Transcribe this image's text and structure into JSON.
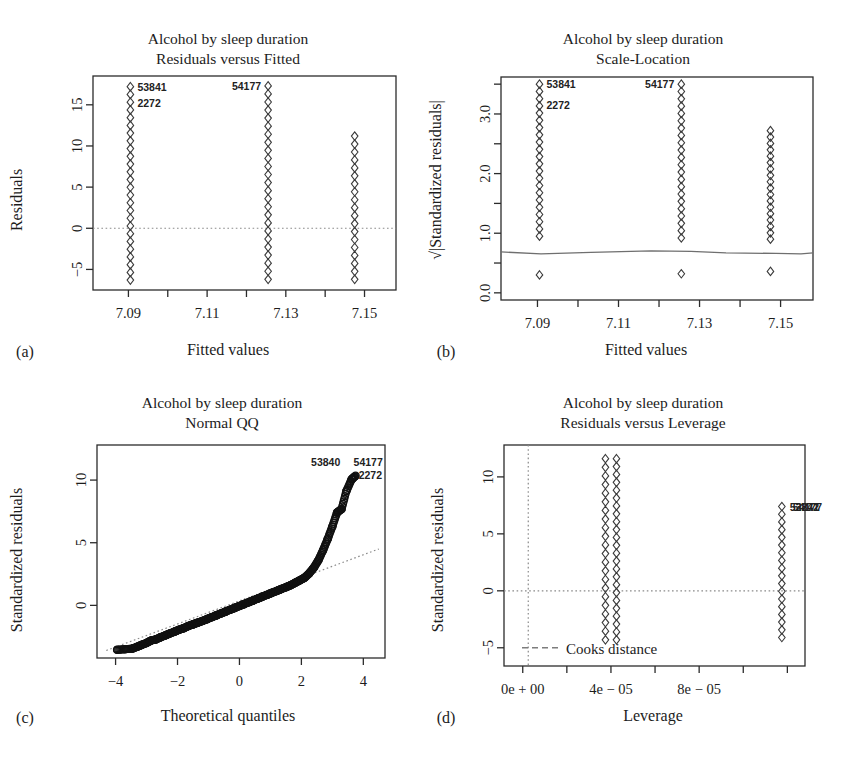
{
  "figure": {
    "width": 842,
    "height": 761,
    "background": "#ffffff",
    "ink": "#1c1c1c",
    "point_stroke": "#3a3a3a",
    "reference_line_color": "#8a8a8a",
    "loess_color": "#6f6f6f"
  },
  "panels": [
    {
      "letter": "(a)",
      "title_line1": "Alcohol by sleep duration",
      "title_line2": "Residuals versus Fitted"
    },
    {
      "letter": "(b)",
      "title_line1": "Alcohol by sleep duration",
      "title_line2": "Scale-Location"
    },
    {
      "letter": "(c)",
      "title_line1": "Alcohol by sleep duration",
      "title_line2": "Normal QQ"
    },
    {
      "letter": "(d)",
      "title_line1": "Alcohol by sleep duration",
      "title_line2": "Residuals versus Leverage"
    }
  ],
  "chart_data": [
    {
      "id": "residuals-vs-fitted",
      "panel": "(a)",
      "type": "scatter",
      "title": "Alcohol by sleep duration\nResiduals versus Fitted",
      "xlabel": "Fitted values",
      "ylabel": "Residuals",
      "xlim": [
        7.081,
        7.158
      ],
      "ylim": [
        -7.5,
        18.5
      ],
      "xticks": [
        7.09,
        7.1,
        7.11,
        7.12,
        7.13,
        7.14,
        7.15
      ],
      "xtick_labels": [
        "7.09",
        "",
        "7.11",
        "",
        "7.13",
        "",
        "7.15"
      ],
      "yticks": [
        -5,
        0,
        5,
        10,
        15
      ],
      "ytick_labels": [
        "−5",
        "0",
        "5",
        "10",
        "15"
      ],
      "grid": false,
      "legend": "none",
      "reference_line": {
        "type": "horizontal",
        "y": 0,
        "style": "dotted"
      },
      "columns": [
        {
          "x": 7.0905,
          "y_min": -6.3,
          "y_max": 17.2,
          "n": 26
        },
        {
          "x": 7.1255,
          "y_min": -6.2,
          "y_max": 17.3,
          "n": 25
        },
        {
          "x": 7.1475,
          "y_min": -6.2,
          "y_max": 11.2,
          "n": 19
        }
      ],
      "point_labels": [
        {
          "text": "53841",
          "x": 7.0905,
          "y": 17.2,
          "side": "right"
        },
        {
          "text": "2272",
          "x": 7.0905,
          "y": 15.2,
          "side": "right"
        },
        {
          "text": "54177",
          "x": 7.1255,
          "y": 17.3,
          "side": "left"
        }
      ]
    },
    {
      "id": "scale-location",
      "panel": "(b)",
      "type": "scatter",
      "title": "Alcohol by sleep duration\nScale-Location",
      "xlabel": "Fitted values",
      "ylabel": "√|Standardized residuals|",
      "xlim": [
        7.081,
        7.158
      ],
      "ylim": [
        -0.12,
        3.62
      ],
      "xticks": [
        7.09,
        7.1,
        7.11,
        7.12,
        7.13,
        7.14,
        7.15
      ],
      "xtick_labels": [
        "7.09",
        "",
        "7.11",
        "",
        "7.13",
        "",
        "7.15"
      ],
      "yticks": [
        0.0,
        0.5,
        1.0,
        1.5,
        2.0,
        2.5,
        3.0,
        3.5
      ],
      "ytick_labels": [
        "0.0",
        "",
        "1.0",
        "",
        "2.0",
        "",
        "3.0",
        ""
      ],
      "grid": false,
      "legend": "none",
      "loess_line": {
        "y_approx": 0.72,
        "style": "solid"
      },
      "columns": [
        {
          "x": 7.0905,
          "y_min": 0.95,
          "y_max": 3.5,
          "n": 22,
          "outlier_low": 0.3
        },
        {
          "x": 7.1255,
          "y_min": 0.92,
          "y_max": 3.5,
          "n": 22,
          "outlier_low": 0.32
        },
        {
          "x": 7.1475,
          "y_min": 0.9,
          "y_max": 2.72,
          "n": 18,
          "outlier_low": 0.36
        }
      ],
      "point_labels": [
        {
          "text": "53841",
          "x": 7.0905,
          "y": 3.5,
          "side": "right"
        },
        {
          "text": "2272",
          "x": 7.0905,
          "y": 3.15,
          "side": "right"
        },
        {
          "text": "54177",
          "x": 7.1255,
          "y": 3.5,
          "side": "left"
        }
      ]
    },
    {
      "id": "normal-qq",
      "panel": "(c)",
      "type": "scatter",
      "title": "Alcohol by sleep duration\nNormal QQ",
      "xlabel": "Theoretical quantiles",
      "ylabel": "Standardized residuals",
      "xlim": [
        -4.6,
        4.7
      ],
      "ylim": [
        -4.2,
        12.8
      ],
      "xticks": [
        -4,
        -2,
        0,
        2,
        4
      ],
      "xtick_labels": [
        "−4",
        "−2",
        "0",
        "2",
        "4"
      ],
      "yticks": [
        0,
        5,
        10
      ],
      "ytick_labels": [
        "0",
        "5",
        "10"
      ],
      "grid": false,
      "legend": "none",
      "qq_reference_line": {
        "style": "dotted",
        "x1": -4.3,
        "y1": -3.6,
        "x2": 4.5,
        "y2": 4.5
      },
      "curve_points_xy": [
        [
          -3.95,
          -3.55
        ],
        [
          -3.7,
          -3.5
        ],
        [
          -3.45,
          -3.45
        ],
        [
          -3.3,
          -3.3
        ],
        [
          -3.15,
          -3.15
        ],
        [
          -3.0,
          -3.0
        ],
        [
          -2.85,
          -2.8
        ],
        [
          -2.7,
          -2.72
        ],
        [
          -2.55,
          -2.55
        ],
        [
          -2.4,
          -2.4
        ],
        [
          -2.25,
          -2.25
        ],
        [
          -2.1,
          -2.1
        ],
        [
          -1.95,
          -1.95
        ],
        [
          -1.8,
          -1.82
        ],
        [
          -1.65,
          -1.65
        ],
        [
          -1.5,
          -1.52
        ],
        [
          -1.35,
          -1.38
        ],
        [
          -1.2,
          -1.25
        ],
        [
          -1.05,
          -1.1
        ],
        [
          -0.9,
          -0.95
        ],
        [
          -0.75,
          -0.8
        ],
        [
          -0.6,
          -0.65
        ],
        [
          -0.45,
          -0.5
        ],
        [
          -0.3,
          -0.35
        ],
        [
          -0.15,
          -0.2
        ],
        [
          0.0,
          -0.05
        ],
        [
          0.15,
          0.1
        ],
        [
          0.3,
          0.25
        ],
        [
          0.45,
          0.4
        ],
        [
          0.6,
          0.55
        ],
        [
          0.75,
          0.7
        ],
        [
          0.9,
          0.85
        ],
        [
          1.05,
          1.0
        ],
        [
          1.2,
          1.15
        ],
        [
          1.35,
          1.3
        ],
        [
          1.5,
          1.45
        ],
        [
          1.65,
          1.6
        ],
        [
          1.8,
          1.8
        ],
        [
          1.95,
          2.0
        ],
        [
          2.1,
          2.2
        ],
        [
          2.25,
          2.55
        ],
        [
          2.4,
          3.0
        ],
        [
          2.55,
          3.6
        ],
        [
          2.7,
          4.4
        ],
        [
          2.85,
          5.3
        ],
        [
          3.0,
          6.3
        ],
        [
          3.15,
          7.4
        ],
        [
          3.3,
          7.7
        ],
        [
          3.45,
          9.1
        ],
        [
          3.62,
          10.05
        ],
        [
          3.75,
          10.35
        ]
      ],
      "point_labels": [
        {
          "text": "53840",
          "x": 3.45,
          "y": 11.1,
          "side": "left"
        },
        {
          "text": "54177",
          "x": 3.8,
          "y": 11.1,
          "side": "right"
        },
        {
          "text": "2272",
          "x": 3.72,
          "y": 10.1,
          "side": "right"
        }
      ]
    },
    {
      "id": "residuals-vs-leverage",
      "panel": "(d)",
      "type": "scatter",
      "title": "Alcohol by sleep duration\nResiduals versus Leverage",
      "xlabel": "Leverage",
      "ylabel": "Standardized residuals",
      "xlim": [
        -8.5e-06,
        0.000128
      ],
      "ylim": [
        -6.6,
        12.8
      ],
      "xticks": [
        0.0,
        2e-05,
        4e-05,
        6e-05,
        8e-05,
        0.0001,
        0.00012
      ],
      "xtick_labels": [
        "0e + 00",
        "",
        "4e − 05",
        "",
        "8e − 05",
        "",
        ""
      ],
      "yticks": [
        -5,
        0,
        5,
        10
      ],
      "ytick_labels": [
        "−5",
        "0",
        "5",
        "10"
      ],
      "grid": false,
      "legend": {
        "position": "bottom-left",
        "label": "Cooks distance",
        "style": "dashed"
      },
      "reference_lines": [
        {
          "type": "horizontal",
          "y": 0,
          "style": "dotted"
        },
        {
          "type": "vertical",
          "x": 2.5e-06,
          "style": "dotted"
        }
      ],
      "columns": [
        {
          "x": 3.75e-05,
          "y_min": -4.3,
          "y_max": 11.6,
          "n": 22
        },
        {
          "x": 4.25e-05,
          "y_min": -4.3,
          "y_max": 11.6,
          "n": 24
        },
        {
          "x": 0.0001175,
          "y_min": -4.1,
          "y_max": 7.4,
          "n": 18
        }
      ],
      "point_labels": [
        {
          "text": "53841",
          "x": 0.0001175,
          "y": 7.4,
          "side": "right"
        },
        {
          "text": "54177",
          "x": 0.0001175,
          "y": 7.4,
          "side": "right"
        },
        {
          "text": "2272",
          "x": 0.0001175,
          "y": 7.4,
          "side": "right"
        }
      ]
    }
  ]
}
